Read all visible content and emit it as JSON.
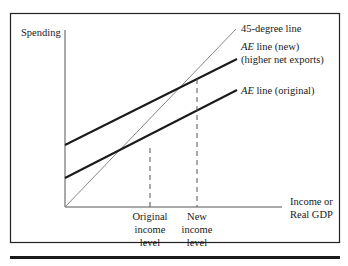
{
  "diagram": {
    "type": "aggregate-expenditure-keynesian-cross",
    "y_axis_label": "Spending",
    "x_axis_label_line1": "Income or",
    "x_axis_label_line2": "Real GDP",
    "lines": {
      "forty_five": {
        "label": "45-degree line"
      },
      "ae_new": {
        "label_italic": "AE",
        "label_rest": " line (new)",
        "label_line2": "(higher net exports)"
      },
      "ae_original": {
        "label_italic": "AE",
        "label_rest": " line (original)"
      }
    },
    "x_markers": {
      "original": {
        "line1": "Original",
        "line2": "income",
        "line3": "level"
      },
      "new": {
        "line1": "New",
        "line2": "income",
        "line3": "level"
      }
    }
  },
  "colors": {
    "frame": "#222222",
    "ae_lines": "#1a1a1a",
    "forty_five_line": "#777777",
    "dashed": "#555555",
    "text": "#1a1a1a"
  }
}
